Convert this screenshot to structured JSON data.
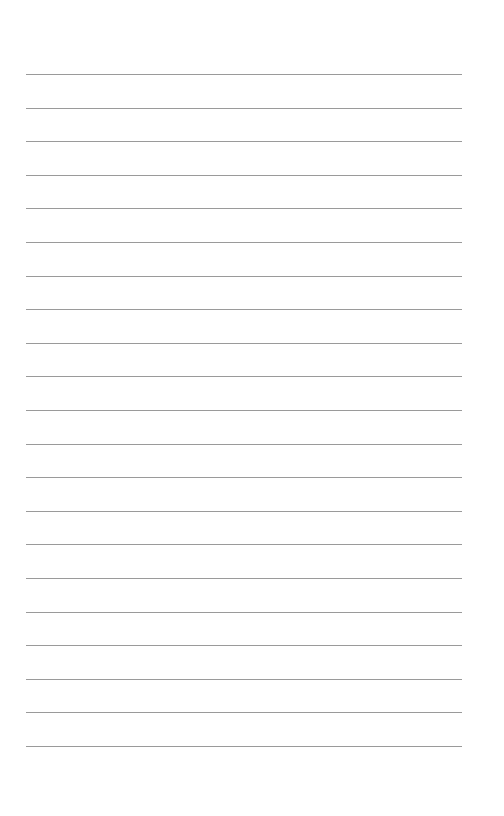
{
  "page": {
    "type": "lined-paper",
    "line_count": 21,
    "first_line_y": 74,
    "line_spacing": 33.6,
    "line_left": 26,
    "line_width": 436,
    "line_color": "#9a9a9a",
    "background_color": "#ffffff"
  }
}
